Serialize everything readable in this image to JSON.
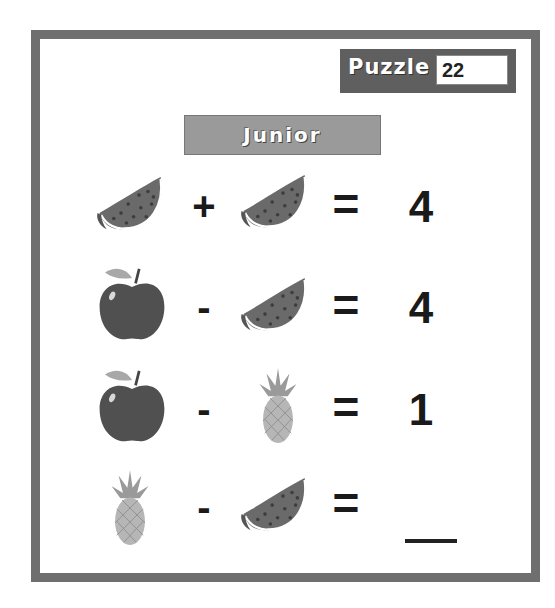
{
  "header": {
    "puzzle_label": "Puzzle",
    "puzzle_number": "22",
    "level_label": "Junior"
  },
  "colors": {
    "frame": "#6f6f6f",
    "puzzle_badge": "#5f5f5f",
    "level_badge": "#9a9a9a",
    "text": "#1a1a1a"
  },
  "equations": [
    {
      "left": "watermelon",
      "operator": "+",
      "right": "watermelon",
      "equals": "=",
      "result": "4"
    },
    {
      "left": "apple",
      "operator": "-",
      "right": "watermelon",
      "equals": "=",
      "result": "4"
    },
    {
      "left": "apple",
      "operator": "-",
      "right": "pineapple",
      "equals": "=",
      "result": "1"
    },
    {
      "left": "pineapple",
      "operator": "-",
      "right": "watermelon",
      "equals": "=",
      "result": ""
    }
  ]
}
